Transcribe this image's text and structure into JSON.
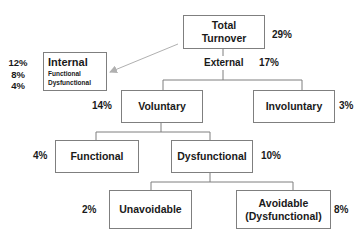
{
  "diagram": {
    "type": "turnover-tree",
    "nodes": {
      "total": {
        "label_line1": "Total",
        "label_line2": "Turnover",
        "pct": "29%"
      },
      "internal": {
        "title": "Internal",
        "sub1": "Functional",
        "sub2": "Dysfunctional",
        "pcts": [
          "12%",
          "8%",
          "4%"
        ]
      },
      "external": {
        "label": "External",
        "pct": "17%"
      },
      "voluntary": {
        "label": "Voluntary",
        "pct": "14%"
      },
      "involuntary": {
        "label": "Involuntary",
        "pct": "3%"
      },
      "functional": {
        "label": "Functional",
        "pct": "4%"
      },
      "dysfunctional": {
        "label": "Dysfunctional",
        "pct": "10%"
      },
      "unavoidable": {
        "label": "Unavoidable",
        "pct": "2%"
      },
      "avoidable": {
        "label_line1": "Avoidable",
        "label_line2": "(Dysfunctional)",
        "pct": "8%"
      }
    },
    "colors": {
      "line": "#7f7f7f",
      "arrow": "#b0b0b0",
      "text": "#1a1a1a"
    }
  }
}
